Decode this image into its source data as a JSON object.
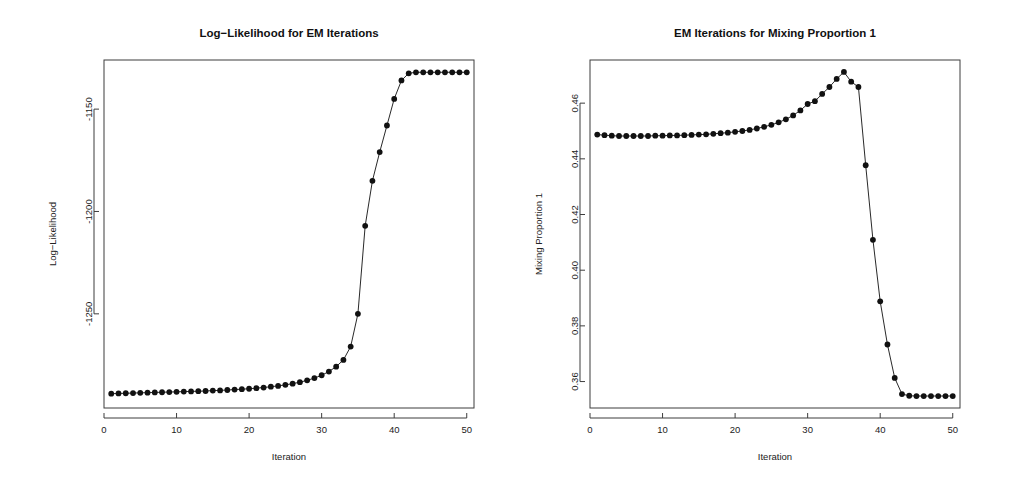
{
  "figure": {
    "background_color": "#ffffff",
    "foreground_color": "#111111",
    "panel_count": 2
  },
  "chart_data": [
    {
      "id": "log-likelihood-panel",
      "type": "scatter",
      "title": "Log−Likelihood for EM Iterations",
      "xlabel": "Iteration",
      "ylabel": "Log−Likelihood",
      "xlim": [
        0.0,
        51.0
      ],
      "ylim": [
        -1296.0,
        -1126.0
      ],
      "xticks": [
        0,
        10,
        20,
        30,
        40,
        50
      ],
      "xticklabels": [
        "0",
        "10",
        "20",
        "30",
        "40",
        "50"
      ],
      "yticks": [
        -1250,
        -1200,
        -1150
      ],
      "yticklabels": [
        "-1250",
        "-1200",
        "-1150"
      ],
      "grid": false,
      "legend": null,
      "marker": "filled-circle",
      "line_style": "solid-thin",
      "x": [
        1,
        2,
        3,
        4,
        5,
        6,
        7,
        8,
        9,
        10,
        11,
        12,
        13,
        14,
        15,
        16,
        17,
        18,
        19,
        20,
        21,
        22,
        23,
        24,
        25,
        26,
        27,
        28,
        29,
        30,
        31,
        32,
        33,
        34,
        35,
        36,
        37,
        38,
        39,
        40,
        41,
        42,
        43,
        44,
        45,
        46,
        47,
        48,
        49,
        50
      ],
      "y": [
        -1289.0,
        -1288.9,
        -1288.8,
        -1288.7,
        -1288.6,
        -1288.5,
        -1288.4,
        -1288.3,
        -1288.2,
        -1288.1,
        -1288.0,
        -1287.9,
        -1287.8,
        -1287.7,
        -1287.5,
        -1287.4,
        -1287.2,
        -1287.0,
        -1286.8,
        -1286.6,
        -1286.3,
        -1286.0,
        -1285.6,
        -1285.2,
        -1284.7,
        -1284.1,
        -1283.4,
        -1282.5,
        -1281.4,
        -1280.0,
        -1278.2,
        -1275.8,
        -1272.5,
        -1266.0,
        -1250.0,
        -1207.0,
        -1185.0,
        -1171.0,
        -1158.0,
        -1145.0,
        -1136.0,
        -1132.5,
        -1132.0,
        -1132.0,
        -1132.0,
        -1132.0,
        -1132.0,
        -1132.0,
        -1132.0,
        -1132.0
      ]
    },
    {
      "id": "mixing-proportion-panel",
      "type": "scatter",
      "title": "EM Iterations for Mixing Proportion 1",
      "xlabel": "Iteration",
      "ylabel": "Mixing Proportion 1",
      "xlim": [
        0.0,
        51.0
      ],
      "ylim": [
        0.3505,
        0.4755
      ],
      "xticks": [
        0,
        10,
        20,
        30,
        40,
        50
      ],
      "xticklabels": [
        "0",
        "10",
        "20",
        "30",
        "40",
        "50"
      ],
      "yticks": [
        0.36,
        0.38,
        0.4,
        0.42,
        0.44,
        0.46
      ],
      "yticklabels": [
        "0.36",
        "0.38",
        "0.40",
        "0.42",
        "0.44",
        "0.46"
      ],
      "grid": false,
      "legend": null,
      "marker": "filled-circle",
      "line_style": "solid-thin",
      "x": [
        1,
        2,
        3,
        4,
        5,
        6,
        7,
        8,
        9,
        10,
        11,
        12,
        13,
        14,
        15,
        16,
        17,
        18,
        19,
        20,
        21,
        22,
        23,
        24,
        25,
        26,
        27,
        28,
        29,
        30,
        31,
        32,
        33,
        34,
        35,
        36,
        37,
        38,
        39,
        40,
        41,
        42,
        43,
        44,
        45,
        46,
        47,
        48,
        49,
        50
      ],
      "y": [
        0.4487,
        0.4485,
        0.4483,
        0.4482,
        0.4482,
        0.4482,
        0.4482,
        0.4482,
        0.4483,
        0.4483,
        0.4484,
        0.4484,
        0.4485,
        0.4486,
        0.4487,
        0.4488,
        0.449,
        0.4492,
        0.4494,
        0.4497,
        0.45,
        0.4504,
        0.4509,
        0.4515,
        0.4522,
        0.4531,
        0.4542,
        0.4556,
        0.4574,
        0.4597,
        0.4607,
        0.4633,
        0.4658,
        0.4687,
        0.4712,
        0.4677,
        0.4658,
        0.4377,
        0.4109,
        0.3888,
        0.3733,
        0.3613,
        0.3555,
        0.3549,
        0.3548,
        0.3548,
        0.3548,
        0.3548,
        0.3548,
        0.3548
      ]
    }
  ]
}
